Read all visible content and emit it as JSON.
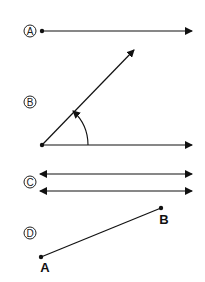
{
  "figures": [
    {
      "label": "A",
      "type": "ray"
    },
    {
      "label": "B",
      "type": "angle"
    },
    {
      "label": "C",
      "type": "parallel-lines"
    },
    {
      "label": "D",
      "type": "line-segment",
      "endpoints": [
        "A",
        "B"
      ]
    }
  ],
  "colors": {
    "stroke": "#111111",
    "background": "#ffffff"
  }
}
